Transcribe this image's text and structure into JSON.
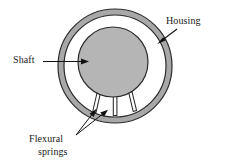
{
  "figure": {
    "type": "engineering-cross-section-diagram",
    "title": "",
    "background": "#ffffff",
    "labels": {
      "housing": "Housing",
      "shaft": "Shaft",
      "flexural_springs_line1": "Flexural",
      "flexural_springs_line2": "springs"
    },
    "colors": {
      "housing_fill": "#a8a8a8",
      "housing_stroke": "#2b2b2b",
      "shaft_fill": "#b5b5b5",
      "shaft_stroke": "#2b2b2b",
      "spring_fill": "#ffffff",
      "spring_stroke": "#2b2b2b",
      "leader_line": "#111111",
      "text": "#1a1a1a"
    },
    "geometry": {
      "housing_center_x": 115,
      "housing_center_y": 66,
      "housing_outer_radius": 57,
      "housing_inner_radius": 51,
      "shaft_center_x": 113,
      "shaft_center_y": 62,
      "shaft_radius": 35,
      "spring_count": 3,
      "spring_legs": [
        {
          "name": "left-spring",
          "top_x": 99,
          "bottom_x": 94
        },
        {
          "name": "center-spring",
          "top_x": 115,
          "bottom_x": 115
        },
        {
          "name": "right-spring",
          "top_x": 130,
          "bottom_x": 134
        }
      ]
    }
  }
}
